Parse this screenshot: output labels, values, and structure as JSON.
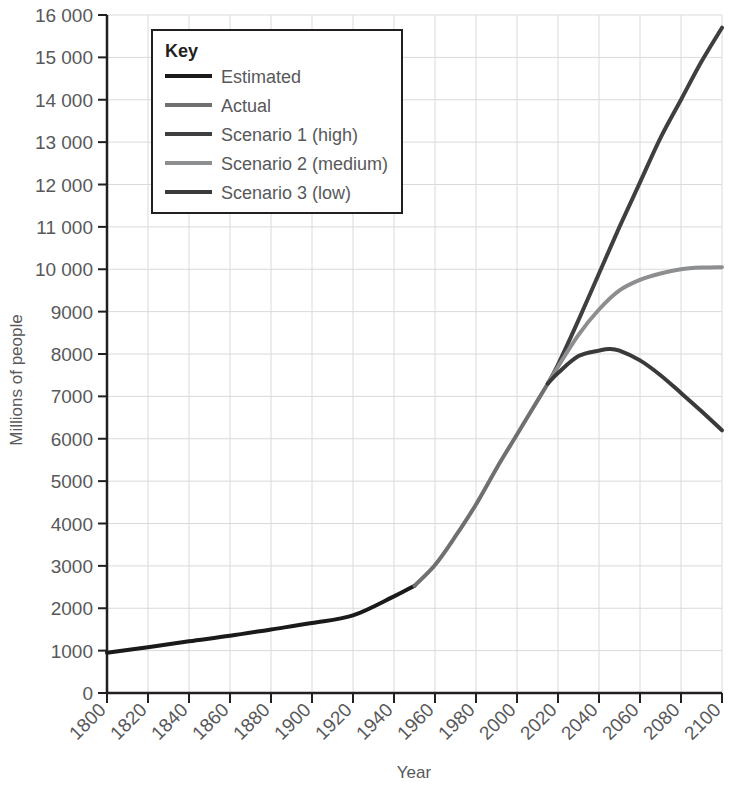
{
  "chart_data": {
    "type": "line",
    "title": "",
    "xlabel": "Year",
    "ylabel": "Millions of people",
    "xlim": [
      1800,
      2100
    ],
    "ylim": [
      0,
      16000
    ],
    "grid": true,
    "legend_position": "top-left",
    "legend_title": "Key",
    "x_ticks": [
      "1800",
      "1820",
      "1840",
      "1860",
      "1880",
      "1900",
      "1920",
      "1940",
      "1960",
      "1980",
      "2000",
      "2020",
      "2040",
      "2060",
      "2080",
      "2100"
    ],
    "y_ticks": [
      "0",
      "1000",
      "2000",
      "3000",
      "4000",
      "5000",
      "6000",
      "7000",
      "8000",
      "9000",
      "10 000",
      "11 000",
      "12 000",
      "13 000",
      "14 000",
      "15 000",
      "16 000"
    ],
    "series": [
      {
        "name": "Estimated",
        "color": "#1a1a1a",
        "x": [
          1800,
          1820,
          1840,
          1860,
          1880,
          1900,
          1920,
          1940,
          1950
        ],
        "values": [
          950,
          1080,
          1220,
          1350,
          1500,
          1650,
          1830,
          2280,
          2530
        ]
      },
      {
        "name": "Actual",
        "color": "#6f7072",
        "x": [
          1950,
          1960,
          1970,
          1980,
          1990,
          2000,
          2010,
          2015
        ],
        "values": [
          2530,
          3020,
          3700,
          4450,
          5300,
          6100,
          6900,
          7300
        ]
      },
      {
        "name": "Scenario 1 (high)",
        "color": "#3f3f41",
        "x": [
          2015,
          2020,
          2030,
          2040,
          2050,
          2060,
          2070,
          2080,
          2090,
          2100
        ],
        "values": [
          7300,
          7750,
          8800,
          9900,
          11000,
          12050,
          13100,
          14000,
          14900,
          15700
        ]
      },
      {
        "name": "Scenario 2 (medium)",
        "color": "#8d8e90",
        "x": [
          2015,
          2020,
          2030,
          2040,
          2050,
          2060,
          2070,
          2080,
          2090,
          2100
        ],
        "values": [
          7300,
          7700,
          8450,
          9050,
          9500,
          9750,
          9900,
          10000,
          10040,
          10050
        ]
      },
      {
        "name": "Scenario 3 (low)",
        "color": "#3a3a3c",
        "x": [
          2015,
          2020,
          2030,
          2040,
          2045,
          2050,
          2060,
          2070,
          2080,
          2090,
          2100
        ],
        "values": [
          7300,
          7550,
          7950,
          8080,
          8120,
          8080,
          7850,
          7500,
          7080,
          6650,
          6200
        ]
      }
    ]
  },
  "axes": {
    "x_title": "Year",
    "y_title": "Millions of people"
  },
  "legend": {
    "title": "Key",
    "entries": [
      {
        "label": "Estimated",
        "color": "#1a1a1a"
      },
      {
        "label": "Actual",
        "color": "#6f7072"
      },
      {
        "label": "Scenario 1 (high)",
        "color": "#3f3f41"
      },
      {
        "label": "Scenario 2 (medium)",
        "color": "#8d8e90"
      },
      {
        "label": "Scenario 3 (low)",
        "color": "#3a3a3c"
      }
    ]
  },
  "colors": {
    "grid": "#d9dadb",
    "axis": "#231f20",
    "text": "#58585a",
    "background": "#ffffff"
  }
}
